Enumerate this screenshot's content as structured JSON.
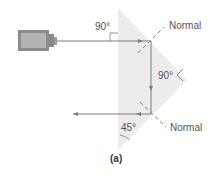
{
  "figure": {
    "caption": "(a)",
    "colors": {
      "prism_fill": "#ececec",
      "beam": "#7a7a7a",
      "normal": "#6e6e6e",
      "text": "#555555",
      "device_body": "#a9a9a9",
      "device_outline": "#6f6f6f"
    },
    "labels": {
      "incident_angle": "90°",
      "upper_normal": "Normal",
      "internal_angle": "90°",
      "lower_normal": "Normal",
      "exit_angle": "45°"
    },
    "components": {
      "light_source": "laser-source",
      "prism": "right-angle-prism"
    }
  }
}
